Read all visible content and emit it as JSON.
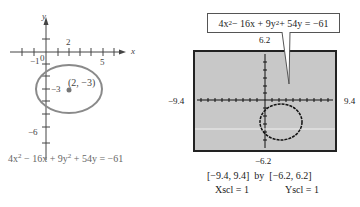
{
  "left_graph": {
    "axis_labels": {
      "x": "x",
      "y": "y"
    },
    "tick_labels": {
      "x_neg1": "−1",
      "origin": "0",
      "x_2": "2",
      "x_5": "5",
      "y_neg3": "−3",
      "y_neg6": "−6"
    },
    "center_point_label": "(2, −3)",
    "equation": {
      "a": "4x",
      "b": " − 16x + 9y",
      "c": " + 54y = −61",
      "exp": "2"
    },
    "colors": {
      "ellipse": "#8a8a8a",
      "axes": "#444444",
      "point": "#777777"
    }
  },
  "right_graph": {
    "callout_equation": {
      "a": "4x",
      "b": " − 16x + 9y",
      "c": " + 54y = −61",
      "exp": "2"
    },
    "window_labels": {
      "ymax": "6.2",
      "ymin": "−6.2",
      "xmin": "−9.4",
      "xmax": "9.4"
    },
    "window_caption": "[−9.4, 9.4]  by  [−6.2, 6.2]",
    "scale_caption": {
      "xscl": "Xscl = 1",
      "yscl": "Yscl = 1"
    },
    "colors": {
      "screen_bg": "#c8c8c8",
      "screen_border": "#222222",
      "plot": "#111111"
    }
  }
}
